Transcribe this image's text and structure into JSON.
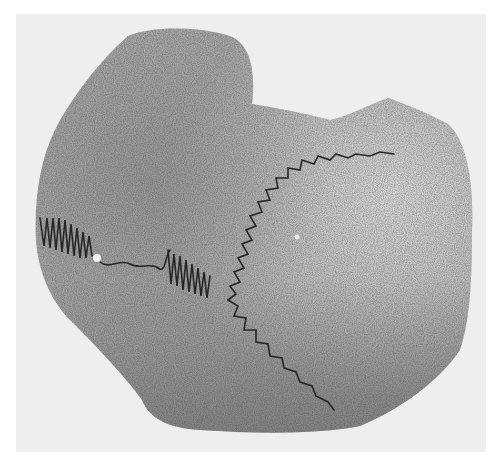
{
  "image": {
    "subject": "skull fragment with cranial sutures",
    "style": "grayscale halftone photograph",
    "colors": {
      "page": "#ffffff",
      "backdrop": "#eeeeee",
      "bone_light": "#c9c9c9",
      "bone_mid": "#a8a8a8",
      "bone_dark": "#7c7c7c",
      "suture": "#2a2a2a"
    }
  }
}
